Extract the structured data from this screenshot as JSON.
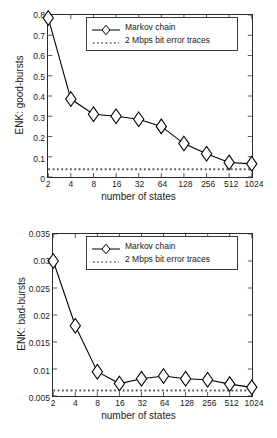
{
  "figures": [
    {
      "id": "good-bursts",
      "ylabel": "ENK: good-bursts",
      "xlabel": "number of states",
      "legend": {
        "series_label": "Markov chain",
        "reference_label": "2 Mbps bit error traces"
      },
      "chart_data": {
        "type": "line",
        "title": "",
        "xlabel": "number of states",
        "ylabel": "ENK: good-bursts",
        "x_scale": "log2-categorical",
        "categories": [
          "2",
          "4",
          "8",
          "16",
          "32",
          "64",
          "128",
          "256",
          "512",
          "1024"
        ],
        "xtick_labels": [
          "2",
          "4",
          "8",
          "16",
          "32",
          "64",
          "128",
          "256",
          "512",
          "1024"
        ],
        "ytick_labels": [
          "0",
          "0.1",
          "0.2",
          "0.3",
          "0.4",
          "0.5",
          "0.6",
          "0.7",
          "0.8"
        ],
        "ylim": [
          0,
          0.8
        ],
        "yticks": [
          0,
          0.1,
          0.2,
          0.3,
          0.4,
          0.5,
          0.6,
          0.7,
          0.8
        ],
        "grid": false,
        "legend_position": "top-right-inside",
        "series": [
          {
            "name": "Markov chain",
            "marker": "diamond",
            "linestyle": "solid",
            "values": [
              0.785,
              0.385,
              0.31,
              0.3,
              0.285,
              0.25,
              0.165,
              0.115,
              0.072,
              0.065
            ]
          },
          {
            "name": "2 Mbps bit error traces",
            "marker": "none",
            "linestyle": "dotted",
            "constant_value": 0.038
          }
        ]
      }
    },
    {
      "id": "bad-bursts",
      "ylabel": "ENK: bad-bursts",
      "xlabel": "number of states",
      "legend": {
        "series_label": "Markov chain",
        "reference_label": "2 Mbps bit error traces"
      },
      "chart_data": {
        "type": "line",
        "title": "",
        "xlabel": "number of states",
        "ylabel": "ENK: bad-bursts",
        "x_scale": "log2-categorical",
        "categories": [
          "2",
          "4",
          "8",
          "16",
          "32",
          "64",
          "128",
          "256",
          "512",
          "1024"
        ],
        "xtick_labels": [
          "2",
          "4",
          "8",
          "16",
          "32",
          "64",
          "128",
          "256",
          "512",
          "1024"
        ],
        "ytick_labels": [
          "0.005",
          "0.01",
          "0.015",
          "0.02",
          "0.025",
          "0.03",
          "0.035"
        ],
        "ylim": [
          0.005,
          0.035
        ],
        "yticks": [
          0.005,
          0.01,
          0.015,
          0.02,
          0.025,
          0.03,
          0.035
        ],
        "grid": false,
        "legend_position": "top-right-inside",
        "series": [
          {
            "name": "Markov chain",
            "marker": "diamond",
            "linestyle": "solid",
            "values": [
              0.03,
              0.018,
              0.0095,
              0.0073,
              0.0082,
              0.0087,
              0.0082,
              0.008,
              0.0072,
              0.0066
            ]
          },
          {
            "name": "2 Mbps bit error traces",
            "marker": "none",
            "linestyle": "dotted",
            "constant_value": 0.006
          }
        ]
      }
    }
  ],
  "colors": {
    "axis": "#2b2b2b",
    "series_line": "#000000",
    "reference_line": "#555555",
    "background": "#ffffff"
  }
}
